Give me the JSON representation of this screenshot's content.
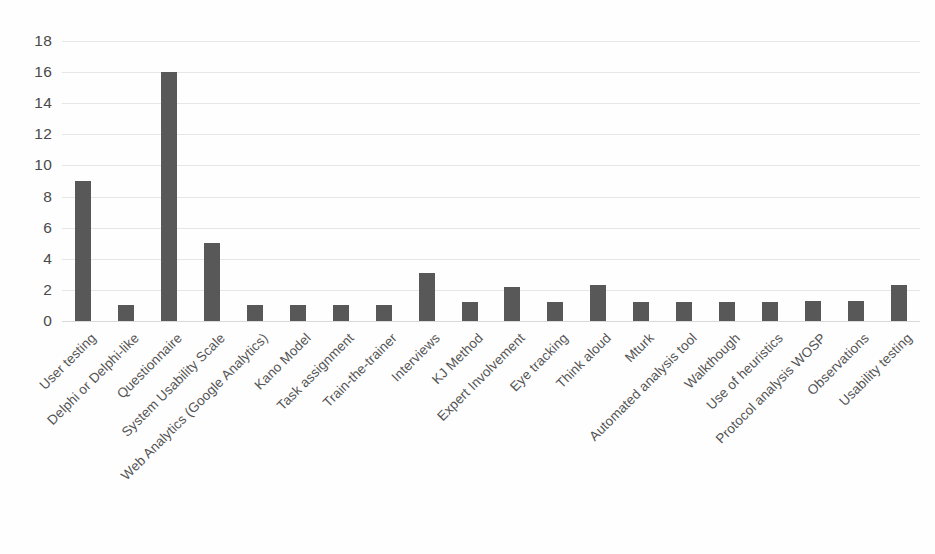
{
  "chart_data": {
    "type": "bar",
    "title": "",
    "subtitle": "",
    "xlabel": "",
    "ylabel": "",
    "ylim": [
      0,
      18
    ],
    "ytick_step": 2,
    "yticks": [
      18,
      16,
      14,
      12,
      10,
      8,
      6,
      4,
      2,
      0
    ],
    "grid": true,
    "legend": false,
    "legend_position": "none",
    "bar_color": "#585858",
    "gridline_color": "#e6e6e6",
    "axis_text_color": "#4a4a4a",
    "categories": [
      "User testing",
      "Delphi or Delphi-like",
      "Questionnaire",
      "System Usability Scale",
      "Web Analytics (Google Analytics)",
      "Kano Model",
      "Task assignment",
      "Train-the-trainer",
      "Interviews",
      "KJ Method",
      "Expert Involvement",
      "Eye tracking",
      "Think aloud",
      "Mturk",
      "Automated analysis tool",
      "Walkthough",
      "Use of heuristics",
      "Protocol analysis WOSP",
      "Observations",
      "Usability testing"
    ],
    "values": [
      9,
      1,
      16,
      5,
      1,
      1,
      1,
      1,
      3.1,
      1.2,
      2.2,
      1.2,
      2.3,
      1.2,
      1.2,
      1.2,
      1.2,
      1.3,
      1.3,
      2.3
    ]
  }
}
